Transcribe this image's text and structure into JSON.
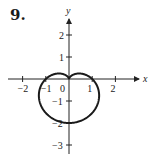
{
  "problem_number": "9.",
  "chart_data": {
    "type": "line",
    "title": "",
    "equation": "r = 1 - sin θ",
    "xlabel": "x",
    "ylabel": "y",
    "xlim": [
      -2.5,
      3
    ],
    "ylim": [
      -3.3,
      2.7
    ],
    "x_ticks": [
      -2,
      -1,
      0,
      1,
      2
    ],
    "x_tick_labels": [
      "−2",
      "−1",
      "0",
      "1",
      "2"
    ],
    "y_ticks": [
      -3,
      -2,
      -1,
      1,
      2
    ],
    "y_tick_labels": [
      "−3",
      "−2",
      "−1",
      "1",
      "2"
    ],
    "grid": false,
    "key_points": [
      {
        "x": 0,
        "y": 0,
        "note": "cusp"
      },
      {
        "x": 1,
        "y": 0
      },
      {
        "x": -1,
        "y": 0
      },
      {
        "x": 0,
        "y": -2,
        "note": "bottom"
      }
    ],
    "series": [
      {
        "name": "cardioid",
        "color": "#1a1a1a"
      }
    ]
  }
}
